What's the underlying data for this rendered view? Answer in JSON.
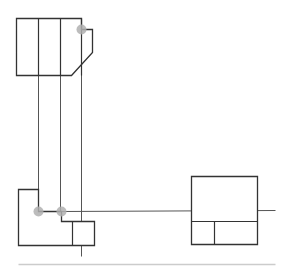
{
  "diagram": {
    "type": "orthographic-projection",
    "colors": {
      "outline": "#333333",
      "projection_line": "#555555",
      "guide_line": "#777777",
      "baseline": "#cccccc",
      "marker": "#b0b0b0"
    },
    "views": {
      "top_view": {
        "outline": [
          [
            16,
            18
          ],
          [
            81,
            18
          ],
          [
            81,
            29
          ],
          [
            92,
            29
          ],
          [
            92,
            52
          ],
          [
            71,
            75
          ],
          [
            16,
            75
          ]
        ],
        "inner_lines": [
          [
            [
              38,
              18
            ],
            [
              38,
              75
            ]
          ],
          [
            [
              60,
              18
            ],
            [
              60,
              75
            ]
          ]
        ]
      },
      "front_view": {
        "outline": [
          [
            18,
            189
          ],
          [
            38,
            189
          ],
          [
            38,
            211
          ],
          [
            61,
            211
          ],
          [
            61,
            221
          ],
          [
            94,
            221
          ],
          [
            94,
            245
          ],
          [
            18,
            245
          ]
        ],
        "inner_lines": [
          [
            [
              72,
              221
            ],
            [
              72,
              245
            ]
          ]
        ]
      },
      "side_view": {
        "outline": [
          [
            191,
            176
          ],
          [
            257,
            176
          ],
          [
            257,
            244
          ],
          [
            191,
            244
          ]
        ],
        "inner_lines": [
          [
            [
              191,
              221
            ],
            [
              257,
              221
            ]
          ],
          [
            [
              214,
              221
            ],
            [
              214,
              244
            ]
          ]
        ]
      }
    },
    "projection_lines": [
      [
        [
          38,
          75
        ],
        [
          38,
          189
        ]
      ],
      [
        [
          60,
          75
        ],
        [
          60,
          211
        ]
      ],
      [
        [
          81,
          29
        ],
        [
          81,
          256
        ]
      ],
      [
        [
          61,
          211
        ],
        [
          275,
          210
        ]
      ]
    ],
    "baseline": [
      [
        18,
        264
      ],
      [
        275,
        264
      ]
    ],
    "markers": [
      {
        "x": 81,
        "y": 29,
        "r": 5
      },
      {
        "x": 38,
        "y": 211,
        "r": 5
      },
      {
        "x": 61,
        "y": 211,
        "r": 5
      }
    ]
  }
}
